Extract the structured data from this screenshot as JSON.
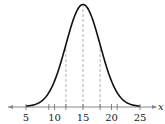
{
  "chart_data": {
    "type": "line",
    "title": "",
    "xlabel": "x",
    "ylabel": "",
    "mean": 15,
    "std_dev": 3,
    "xlim": [
      3,
      27
    ],
    "x_ticks": [
      5,
      10,
      15,
      20,
      25
    ],
    "x_tick_labels": [
      "5",
      "10",
      "15",
      "20",
      "25"
    ],
    "minor_ticks": [
      9,
      12,
      18,
      21
    ],
    "dashed_vertical_lines": [
      12,
      15,
      18
    ],
    "grid": false,
    "legend": null,
    "axis_arrows": "both",
    "colors": {
      "curve": "#111111",
      "axis": "#888888",
      "dashed": "#999999"
    }
  }
}
